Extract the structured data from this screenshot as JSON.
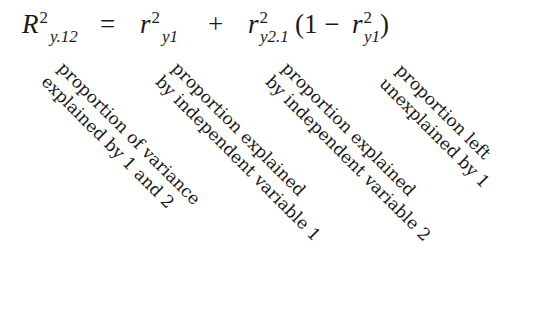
{
  "equation": {
    "lhs": {
      "symbol": "R",
      "superscript": "2",
      "subscript": "y.12"
    },
    "equals": "=",
    "term1": {
      "symbol": "r",
      "superscript": "2",
      "subscript": "y1"
    },
    "plus": "+",
    "term2": {
      "symbol": "r",
      "superscript": "2",
      "subscript": "y2.1"
    },
    "open_paren_one_minus": "(1 −",
    "term3": {
      "symbol": "r",
      "superscript": "2",
      "subscript": "y1"
    },
    "close_paren": ")"
  },
  "labels": [
    {
      "line1": "proportion of variance",
      "line2": "explained by 1 and 2"
    },
    {
      "line1": "proportion explained",
      "line2": "by independent variable 1"
    },
    {
      "line1": "proportion explained",
      "line2": "by independent variable 2"
    },
    {
      "line1": "proportion left",
      "line2": "unexplained by 1"
    }
  ]
}
